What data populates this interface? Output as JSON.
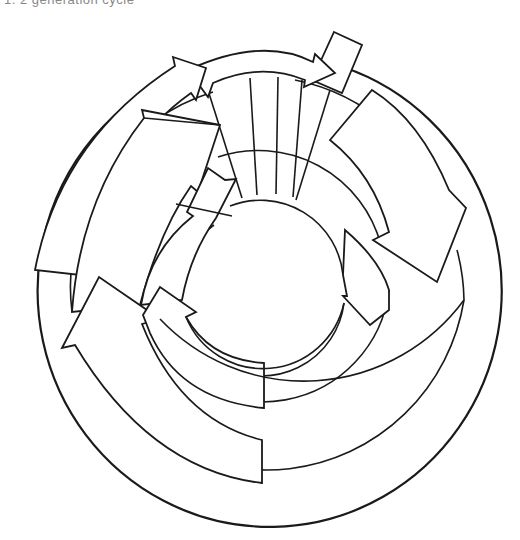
{
  "caption": "1.  2  generation cycle",
  "diagram": {
    "rings": [
      "outer-ring",
      "second-ring",
      "third-ring",
      "inner-circle"
    ],
    "arrows": [
      "top-outer-arrow",
      "upper-left-outer-arrow",
      "upper-left-middle-arrow",
      "upper-left-inner-arrow",
      "right-outer-arrow",
      "right-inner-arrow",
      "lower-left-outer-arrow",
      "lower-left-inner-arrow"
    ],
    "connectors": [
      "spoke-bundle",
      "top-right-tab"
    ],
    "stroke_color": "#1a1a1a",
    "background": "#ffffff"
  }
}
